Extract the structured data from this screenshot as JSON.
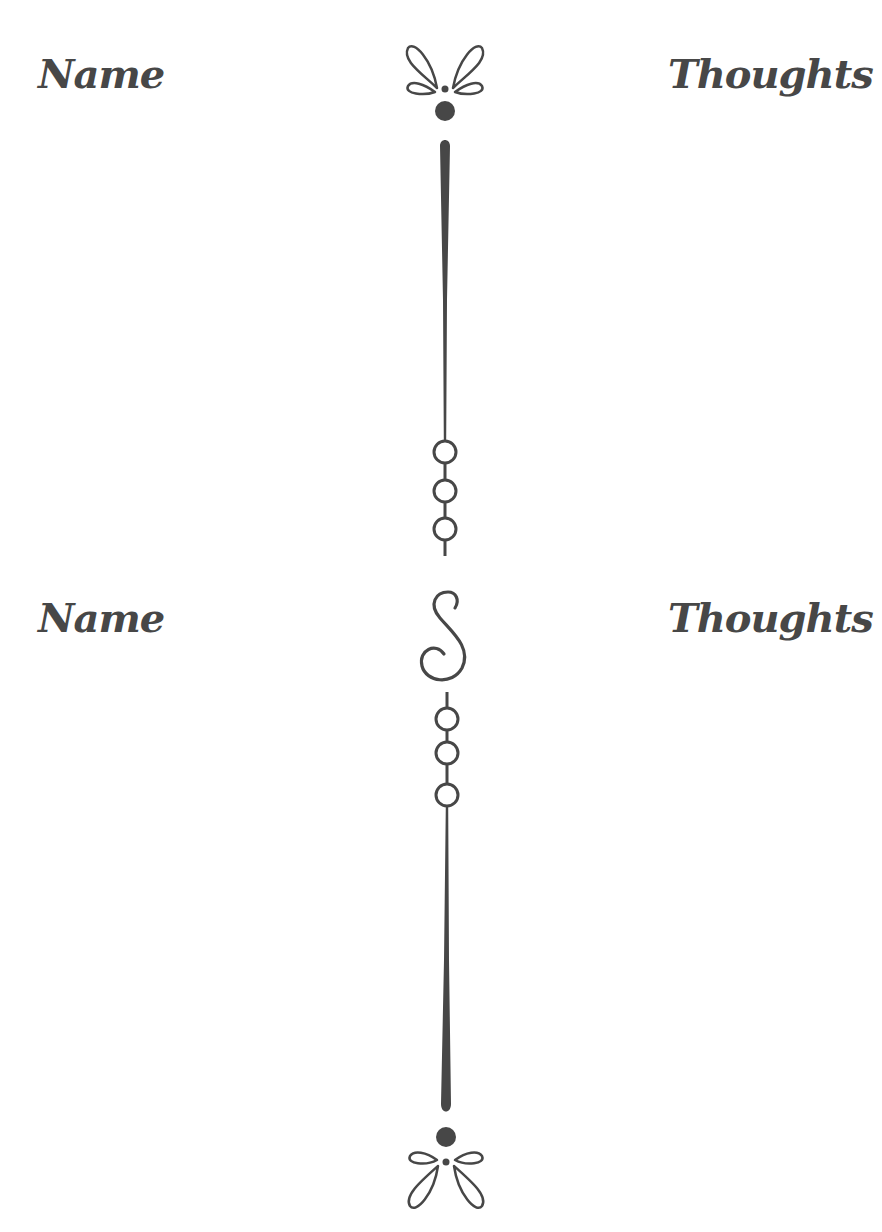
{
  "sections": [
    {
      "left_heading": "Name",
      "right_heading": "Thoughts"
    },
    {
      "left_heading": "Name",
      "right_heading": "Thoughts"
    }
  ],
  "colors": {
    "ink": "#474747",
    "background": "#ffffff"
  },
  "ornaments": {
    "top": "fleur-bow-icon",
    "middle": "s-scroll-icon",
    "bottom": "fleur-bow-icon",
    "divider": "bead-chain-divider"
  }
}
